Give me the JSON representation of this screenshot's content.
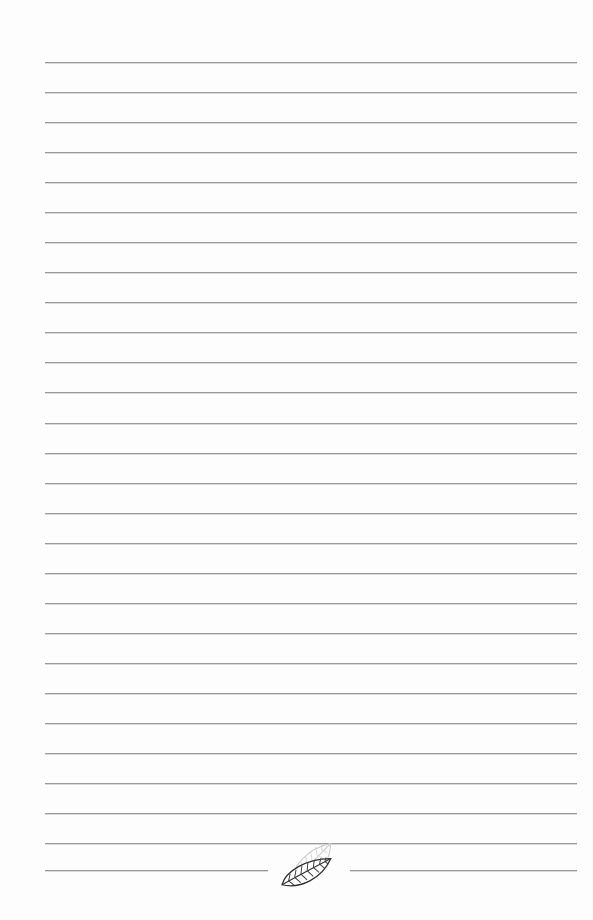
{
  "page": {
    "width": 593,
    "height": 920,
    "background_color": "#fdfdfd",
    "paper_margin_color": "#ffffff"
  },
  "ruling": {
    "line_color": "#9a9a9a",
    "line_shadow_color": "#bebebe",
    "line_thickness_px": 1,
    "line_spacing_px": 30,
    "left_x": 45,
    "right_x": 577,
    "line_width_px": 532,
    "first_line_y": 62,
    "last_line_y": 870,
    "line_count": 28,
    "line_y_positions": [
      62,
      92,
      122,
      152,
      182,
      212,
      242,
      272,
      302,
      332,
      362,
      392,
      423,
      453,
      483,
      513,
      543,
      573,
      603,
      633,
      663,
      693,
      723,
      753,
      783,
      813,
      843,
      870
    ],
    "content_text": ""
  },
  "final_line": {
    "y": 870,
    "left_segment": {
      "start_x": 45,
      "end_x": 268
    },
    "right_segment": {
      "start_x": 350,
      "end_x": 577
    },
    "gap_start_x": 268,
    "gap_end_x": 350
  },
  "decoration": {
    "name": "leaf-motif",
    "description": "Two overlapping hand-drawn leaves at bottom center interrupting the last ruled line",
    "center_x": 308,
    "center_y": 864,
    "bounds": {
      "x": 272,
      "y": 840,
      "width": 74,
      "height": 50
    },
    "leaves": [
      {
        "name": "back-leaf",
        "style": "light gray outline with veins",
        "stroke_color": "#c9c9c9",
        "fill_color": "#fcfcfc",
        "rotation_deg": -34
      },
      {
        "name": "front-leaf",
        "style": "dark outline with serrated edge and veins",
        "stroke_color": "#2f2f33",
        "fill_color": "#ffffff",
        "rotation_deg": -20
      }
    ]
  }
}
